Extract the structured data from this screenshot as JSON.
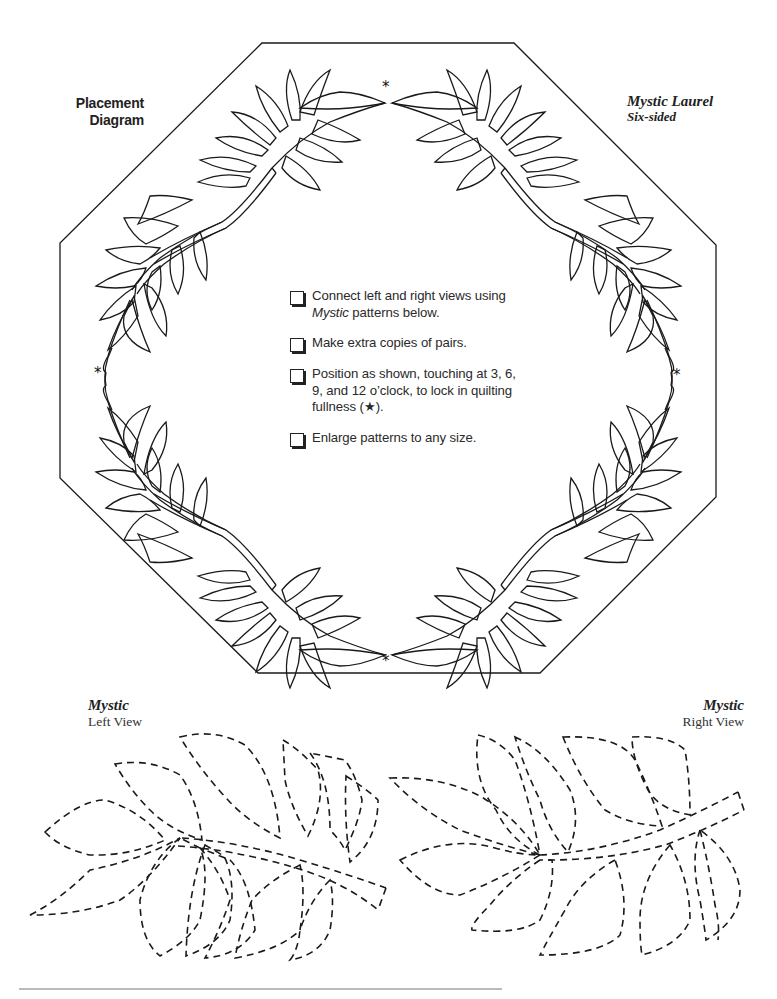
{
  "page": {
    "placement_diagram": {
      "line1": "Placement",
      "line2": "Diagram"
    },
    "pattern_title": {
      "name": "Mystic Laurel",
      "subtitle": "Six-sided"
    },
    "instructions": [
      {
        "text_before": "Connect left and right views using ",
        "italic": "Mystic",
        "text_after": " patterns below."
      },
      {
        "text_before": "Make extra copies of pairs.",
        "italic": "",
        "text_after": ""
      },
      {
        "text_before": "Position as shown, touching at 3, 6, 9, and 12 o’clock, to lock in quilting fullness (",
        "italic": "",
        "text_after": "★)."
      },
      {
        "text_before": "Enlarge patterns to any size.",
        "italic": "",
        "text_after": ""
      }
    ],
    "markers": {
      "star_glyph": "*"
    },
    "left_view": {
      "title": "Mystic",
      "subtitle": "Left View"
    },
    "right_view": {
      "title": "Mystic",
      "subtitle": "Right View"
    },
    "colors": {
      "ink": "#1a1a1a",
      "background": "#ffffff",
      "rule": "#777777"
    }
  }
}
